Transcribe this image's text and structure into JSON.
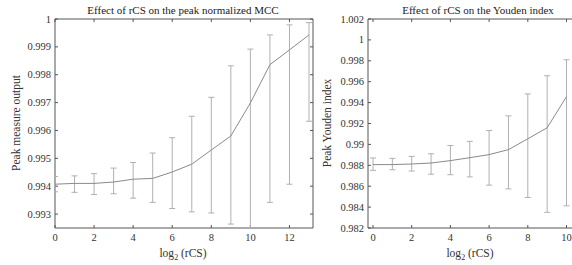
{
  "chart_data": [
    {
      "type": "line",
      "title": "Effect of  rCS on the peak normalized MCC",
      "xlabel": "log2 (rCS)",
      "xlabel_base": "log",
      "xlabel_sub": "2",
      "xlabel_rest": " (rCS)",
      "ylabel": "Peak measure output",
      "xlim": [
        0,
        13
      ],
      "ylim": [
        0.9925,
        1.0
      ],
      "xticks": [
        0,
        2,
        4,
        6,
        8,
        10,
        12
      ],
      "yticks": [
        0.993,
        0.994,
        0.995,
        0.996,
        0.997,
        0.998,
        0.999,
        1
      ],
      "ytick_labels": [
        "0.993",
        "0.994",
        "0.995",
        "0.996",
        "0.997",
        "0.998",
        "0.999",
        "1"
      ],
      "grid": false,
      "error_bars": true,
      "series": [
        {
          "name": "Peak normalized MCC",
          "x": [
            0,
            1,
            2,
            3,
            4,
            5,
            6,
            7,
            8,
            9,
            10,
            11,
            12,
            13
          ],
          "values": [
            0.99407,
            0.9941,
            0.9941,
            0.99415,
            0.99425,
            0.99428,
            0.99451,
            0.99479,
            0.9953,
            0.9958,
            0.99699,
            0.99836,
            0.99889,
            0.99943
          ],
          "err_high": [
            0.99435,
            0.99437,
            0.99445,
            0.99465,
            0.99485,
            0.99519,
            0.99574,
            0.99651,
            0.99719,
            0.99832,
            0.99892,
            0.99943,
            0.99979,
            0.99987
          ],
          "err_low": [
            0.9938,
            0.99378,
            0.9937,
            0.99373,
            0.99357,
            0.99342,
            0.9932,
            0.99308,
            0.99304,
            0.99264,
            0.9925,
            0.99342,
            0.99407,
            0.99633
          ]
        }
      ]
    },
    {
      "type": "line",
      "title": "Effect of rCS on the Youden index",
      "xlabel": "log2 (rCS)",
      "xlabel_base": "log",
      "xlabel_sub": "2",
      "xlabel_rest": " (rCS)",
      "ylabel": "Peak Youden index",
      "xlim": [
        0,
        10
      ],
      "ylim": [
        0.982,
        1.002
      ],
      "xticks": [
        0,
        2,
        4,
        6,
        8,
        10
      ],
      "yticks": [
        0.982,
        0.984,
        0.986,
        0.988,
        0.99,
        0.992,
        0.994,
        0.996,
        0.998,
        1,
        1.002
      ],
      "ytick_labels": [
        "0.982",
        "0.984",
        "0.986",
        "0.988",
        "0.99",
        "0.992",
        "0.994",
        "0.996",
        "0.998",
        "1",
        "1.002"
      ],
      "grid": false,
      "error_bars": true,
      "series": [
        {
          "name": "Peak Youden index",
          "x": [
            0,
            1,
            2,
            3,
            4,
            5,
            6,
            7,
            8,
            9,
            10
          ],
          "values": [
            0.98807,
            0.98807,
            0.98812,
            0.98822,
            0.98845,
            0.98873,
            0.98902,
            0.9895,
            0.99054,
            0.99159,
            0.99457
          ],
          "err_high": [
            0.9887,
            0.98866,
            0.98885,
            0.9891,
            0.9899,
            0.99029,
            0.99133,
            0.99273,
            0.99483,
            0.99657,
            0.9981
          ],
          "err_low": [
            0.98752,
            0.98757,
            0.98745,
            0.98715,
            0.9871,
            0.98689,
            0.9861,
            0.98574,
            0.98492,
            0.9835,
            0.98412
          ]
        }
      ]
    }
  ],
  "style": {
    "line_color": "#8a8a8a",
    "errorbar_color": "#b0b0b0",
    "axis_color": "#555555",
    "text_color": "#333333"
  }
}
